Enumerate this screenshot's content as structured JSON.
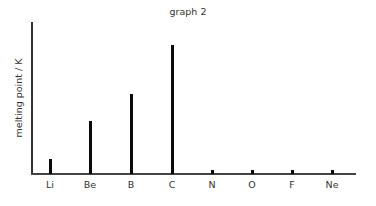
{
  "chart_data": {
    "type": "bar",
    "title": "graph 2",
    "xlabel": "",
    "ylabel": "melting point / K",
    "categories": [
      "Li",
      "Be",
      "B",
      "C",
      "N",
      "O",
      "F",
      "Ne"
    ],
    "values": [
      454,
      1560,
      2349,
      3800,
      63,
      54,
      53,
      25
    ],
    "ylim": [
      0,
      4500
    ],
    "grid": false,
    "legend": null,
    "y_ticks_shown": false
  },
  "layout": {
    "baseline_px": 174,
    "px_per_unit": 0.0339,
    "bar_x_px": [
      50,
      90,
      131,
      172,
      212,
      252,
      292,
      332
    ]
  },
  "colors": {
    "bar": "#0a0a0a",
    "axis": "#333333",
    "text": "#333333"
  }
}
